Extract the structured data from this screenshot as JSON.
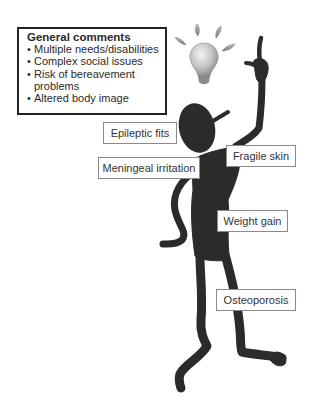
{
  "general_comments": {
    "title": "General comments",
    "items": [
      "Multiple needs/disabilities",
      "Complex social issues",
      "Risk of bereavement problems",
      "Altered body image"
    ]
  },
  "labels": {
    "epileptic_fits": "Epileptic fits",
    "meningeal_irritation": "Meningeal irritation",
    "fragile_skin": "Fragile skin",
    "weight_gain": "Weight gain",
    "osteoporosis": "Osteoporosis"
  },
  "icons": {
    "lightbulb": "lightbulb-icon",
    "figure": "stick-figure"
  },
  "colors": {
    "figure": "#2b2b2b",
    "border": "#222222",
    "label_border": "#8a8a8a",
    "bulb": "#c8c8c8"
  }
}
